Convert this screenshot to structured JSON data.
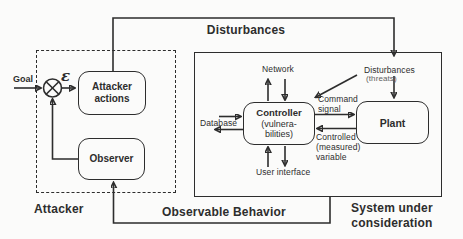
{
  "colors": {
    "ink": "#2d2d2d",
    "muted": "#5f5f5f",
    "bg": "#fbfbfa"
  },
  "top": {
    "disturbances_label": "Disturbances"
  },
  "attacker": {
    "frame_label": "Attacker",
    "goal_label": "Goal",
    "error_symbol": "ε",
    "actions_box": [
      "Attacker",
      "actions"
    ],
    "observer_box": "Observer"
  },
  "system": {
    "frame_label": [
      "System under",
      "consideration"
    ],
    "network_label": "Network",
    "disturbances_label": "Disturbances",
    "threats_label": "(threats)",
    "database_label": "Database",
    "user_interface_label": "User interface",
    "command_signal_label": [
      "Command",
      "signal"
    ],
    "controlled_variable_label": [
      "Controlled",
      "(measured)",
      "variable"
    ],
    "controller_box": [
      "Controller",
      "(vulnera-",
      "bilities)"
    ],
    "plant_box": "Plant"
  },
  "bottom": {
    "observable_label": "Observable Behavior"
  }
}
